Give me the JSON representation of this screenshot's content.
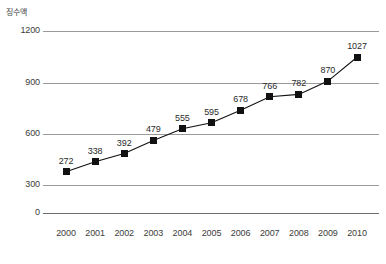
{
  "chart_data": {
    "type": "line",
    "title": "",
    "ylabel": "징수액",
    "xlabel": "",
    "categories": [
      "2000",
      "2001",
      "2002",
      "2003",
      "2004",
      "2005",
      "2006",
      "2007",
      "2008",
      "2009",
      "2010"
    ],
    "values": [
      272,
      338,
      392,
      479,
      555,
      595,
      678,
      766,
      782,
      870,
      1027
    ],
    "data_labels": [
      "272",
      "338",
      "392",
      "479",
      "555",
      "595",
      "678",
      "766",
      "782",
      "870",
      "1027"
    ],
    "yticks": [
      "0",
      "300",
      "600",
      "900",
      "1200"
    ],
    "ylim": [
      0,
      1200
    ],
    "grid": true,
    "legend": "none",
    "series_color": "#111111",
    "grid_color": "#9a9a9a",
    "marker": "square"
  }
}
